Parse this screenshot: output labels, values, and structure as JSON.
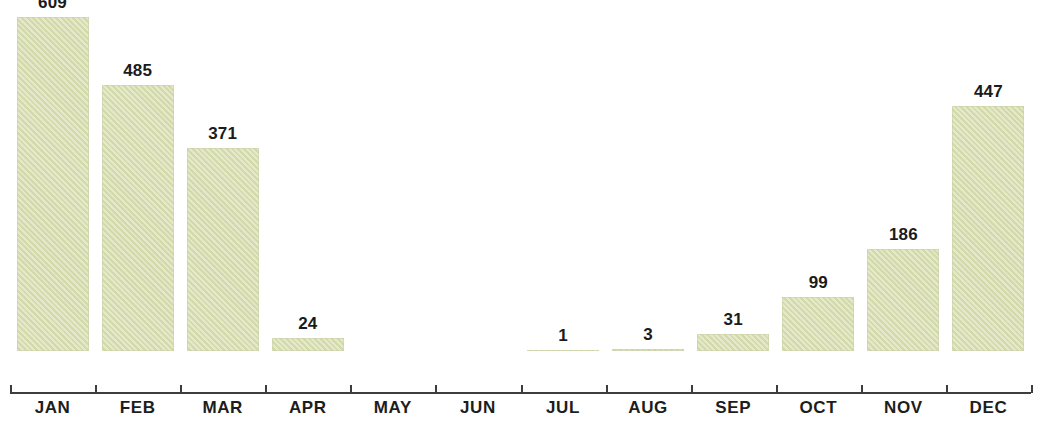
{
  "chart_data": {
    "type": "bar",
    "title": "",
    "subtitle": "",
    "xlabel": "",
    "ylabel": "",
    "categories": [
      "JAN",
      "FEB",
      "MAR",
      "APR",
      "MAY",
      "JUN",
      "JUL",
      "AUG",
      "SEP",
      "OCT",
      "NOV",
      "DEC"
    ],
    "values": [
      609,
      485,
      371,
      24,
      0,
      0,
      1,
      3,
      31,
      99,
      186,
      447
    ],
    "value_labels": [
      "609",
      "485",
      "371",
      "24",
      "",
      "",
      "1",
      "3",
      "31",
      "99",
      "186",
      "447"
    ],
    "series": [
      {
        "name": "Monthly total",
        "values": [
          609,
          485,
          371,
          24,
          0,
          0,
          1,
          3,
          31,
          99,
          186,
          447
        ]
      }
    ],
    "ylim": [
      0,
      660
    ],
    "grid": false,
    "legend": "none",
    "bar_color": "#d9dfb2",
    "axis_color": "#3d3d3b",
    "label_color": "#1b1b1b",
    "background_color": "#ffffff"
  },
  "axis": {
    "ticks_visible": true,
    "tick_count": 11
  }
}
